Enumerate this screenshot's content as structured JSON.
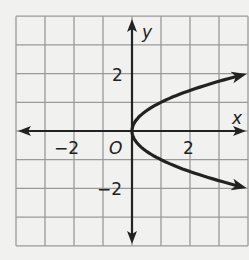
{
  "chart_data": {
    "type": "line",
    "title": "",
    "xlabel": "x",
    "ylabel": "y",
    "origin_label": "O",
    "xlim": [
      -4,
      4
    ],
    "ylim": [
      -4,
      4
    ],
    "grid": true,
    "x_ticks": [
      {
        "value": -2,
        "label": "−2"
      },
      {
        "value": 2,
        "label": "2"
      }
    ],
    "y_ticks": [
      {
        "value": 2,
        "label": "2"
      },
      {
        "value": -2,
        "label": "−2"
      }
    ],
    "series": [
      {
        "name": "x = y^2",
        "relation": "x = y^2",
        "points": [
          [
            3.9,
            1.975
          ],
          [
            2.25,
            1.5
          ],
          [
            1,
            1
          ],
          [
            0.25,
            0.5
          ],
          [
            0,
            0
          ],
          [
            0.25,
            -0.5
          ],
          [
            1,
            -1
          ],
          [
            2.25,
            -1.5
          ],
          [
            3.9,
            -1.975
          ]
        ],
        "arrows_at_ends": true
      }
    ],
    "colors": {
      "curve": "#222222",
      "grid": "#9a9a9a",
      "axes": "#222222",
      "background": "#f1f1ef"
    }
  }
}
